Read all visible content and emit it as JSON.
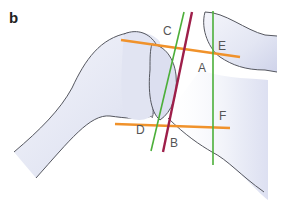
{
  "figure": {
    "panel_label": "b"
  },
  "points": {
    "A": "A",
    "B": "B",
    "C": "C",
    "D": "D",
    "E": "E",
    "F": "F"
  },
  "lines": [
    {
      "name": "line-CE",
      "color": "#f0922b",
      "from": "C",
      "to": "E"
    },
    {
      "name": "line-DF",
      "color": "#f0922b",
      "from": "D",
      "to": "F"
    },
    {
      "name": "line-glenoid-axis",
      "color": "#9e1f4a",
      "through": [
        "A",
        "B"
      ]
    },
    {
      "name": "line-CD",
      "color": "#4caf3a",
      "through": [
        "C",
        "D"
      ]
    },
    {
      "name": "line-EF",
      "color": "#4caf3a",
      "through": [
        "E",
        "F"
      ]
    }
  ],
  "colors": {
    "orange": "#f0922b",
    "crimson": "#9e1f4a",
    "green": "#4caf3a",
    "bone_fill": "#e6e8f4",
    "bone_outline": "#55575f"
  }
}
